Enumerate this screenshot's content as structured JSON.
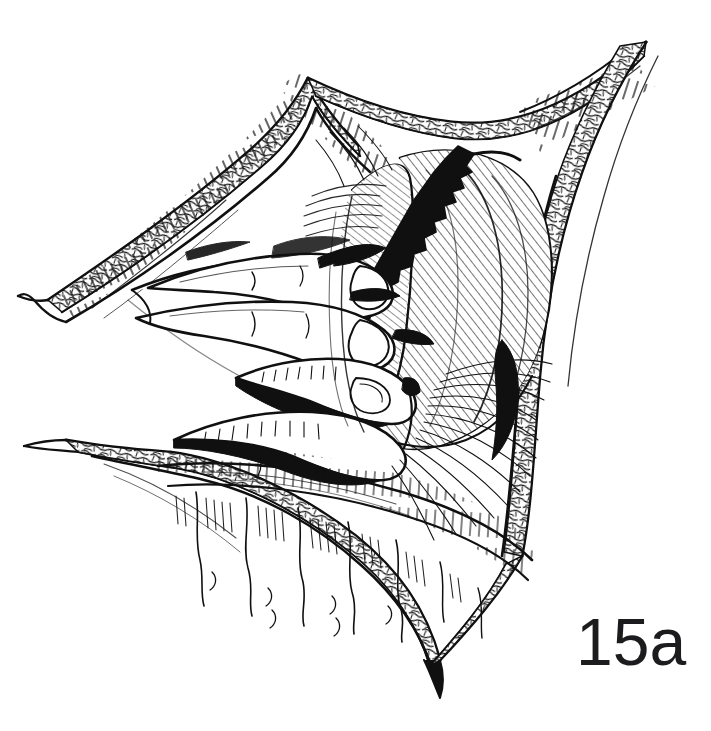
{
  "figure": {
    "label": "15a",
    "caption_visible": false,
    "background_color": "#ffffff",
    "ink_color": "#101010",
    "medium": "pen-and-ink line drawing"
  },
  "bleed_through": {
    "visible": true,
    "note": "faint mirrored show-through text from the reverse of the printed page, illegible",
    "line1": "CHIRURGIE",
    "line2": "OPERATIVE",
    "color": "#5a5f78",
    "opacity": "0.055"
  },
  "illustration_parts": [
    {
      "name": "upper-skin-flap",
      "description": "upper retracted skin and subcutaneous fat flap with stippled fat layer and hatched dermal edge"
    },
    {
      "name": "right-skin-flap",
      "description": "right retracted skin flap descending vertically with stippled fat border"
    },
    {
      "name": "lower-left-skin-flap",
      "description": "lower-left retracted skin flap forming the left limb of the V"
    },
    {
      "name": "incision-apex",
      "description": "sharp V apex of the incision at the lower centre of the wound"
    },
    {
      "name": "surgeons-hand",
      "description": "surgeon's hand entering the wound from the left, index and middle fingers extended"
    },
    {
      "name": "finger-index",
      "description": "uppermost extended finger palpating deep tissue"
    },
    {
      "name": "finger-middle",
      "description": "second extended finger below the index"
    },
    {
      "name": "finger-ring",
      "description": "third flexed finger resting on the lower tissue"
    },
    {
      "name": "viscus-dome",
      "description": "large smooth domed organ surface rendered with fine parallel hatching"
    },
    {
      "name": "dark-jagged-edge",
      "description": "heavy black irregular band marking a divided or torn tissue margin at the organ's upper left"
    },
    {
      "name": "fan-hatching",
      "description": "radiating fan of fine lines indicating stretched fascia / adhesions on the right"
    },
    {
      "name": "lower-tissue-folds",
      "description": "wavy vertical folds of tissue filling the lower portion of the wound"
    },
    {
      "name": "fat-stipple-border",
      "description": "cobblestone stipple pattern running along every cut skin margin representing subcutaneous fat"
    }
  ],
  "palette": {
    "paper": "#ffffff",
    "ink": "#101010",
    "ink_soft": "#2a2a2a",
    "label_ink": "#1c1c1e"
  }
}
